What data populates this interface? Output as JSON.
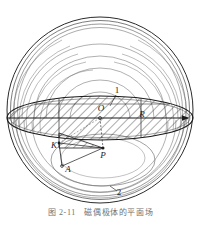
{
  "figure": {
    "caption": "图 2-11　磁偶极体的平面场",
    "colors": {
      "ink": "#1a1a1a",
      "line": "#2b2b2b",
      "hatch": "#3a3a3a",
      "faint": "#6e6e6e",
      "background": "#ffffff",
      "caption": "#4a4a4a"
    },
    "geometry": {
      "sphere_center_x": 100,
      "sphere_center_y": 110,
      "sphere_radius": 93,
      "ellipse_center_x": 100,
      "ellipse_center_y": 118,
      "ellipse_rx": 93,
      "ellipse_ry": 22
    },
    "labels": [
      {
        "id": "label-O",
        "text": "O",
        "x": 101,
        "y": 111,
        "kind": "point"
      },
      {
        "id": "label-R",
        "text": "R",
        "x": 142,
        "y": 117,
        "kind": "point"
      },
      {
        "id": "label-P",
        "text": "P",
        "x": 103,
        "y": 156,
        "kind": "point"
      },
      {
        "id": "label-K",
        "text": "K",
        "x": 54,
        "y": 148,
        "kind": "point"
      },
      {
        "id": "label-A",
        "text": "A",
        "x": 68,
        "y": 170,
        "kind": "point"
      },
      {
        "id": "label-1",
        "text": "1",
        "x": 117,
        "y": 92,
        "kind": "region"
      },
      {
        "id": "label-2",
        "text": "2",
        "x": 119,
        "y": 194,
        "kind": "region"
      }
    ],
    "points": [
      {
        "id": "point-O",
        "x": 100,
        "y": 118
      },
      {
        "id": "point-P",
        "x": 103,
        "y": 148
      },
      {
        "id": "point-K",
        "x": 59,
        "y": 143
      },
      {
        "id": "point-A",
        "x": 62,
        "y": 166
      }
    ],
    "axis_arrow": {
      "id": "major-axis-arrow",
      "from_x": 100,
      "from_y": 118,
      "to_x": 193,
      "to_y": 118,
      "direction": "right"
    },
    "field_line_count": 8,
    "hatch_angle_deg": 45
  }
}
